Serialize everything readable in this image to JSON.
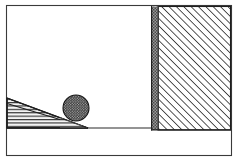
{
  "figure": {
    "title": "Ball resting against inclined wedge beside hatched wall",
    "type": "line-diagram",
    "caption": "",
    "background_color": "#ffffff",
    "ink_color": "#1e1e1e",
    "canvas": {
      "width": 237,
      "height": 161
    }
  },
  "frame": {
    "name": "outer-border",
    "x": 6,
    "y": 5,
    "width": 225,
    "height": 150,
    "stroke_color": "#3a3a3a",
    "stroke_width": 1.1
  },
  "ground": {
    "label": "",
    "y": 128,
    "x_start": 6,
    "x_end": 152,
    "stroke_color": "#2b2b2b"
  },
  "wedge": {
    "name": "inclined-ramp",
    "fill_pattern": "horizontal-hatch",
    "fill_color": "#f2f2f2",
    "hatch_color": "#1e1e1e",
    "apex_x": 88,
    "apex_y": 128,
    "top_x": 7,
    "top_y": 98,
    "base_x": 7,
    "base_y": 128,
    "incline_degrees": 20
  },
  "ball": {
    "name": "sphere",
    "fill_pattern": "stipple-dots",
    "fill_color": "#3c3c3c",
    "dot_color": "#111111",
    "center_x": 76,
    "center_y": 108,
    "radius": 13
  },
  "wall": {
    "name": "fixed-wall-block",
    "fill_pattern": "diagonal-hatch-45",
    "fill_color": "#ffffff",
    "hatch_color": "#1e1e1e",
    "edge_band_color": "#8e8e8e",
    "x": 151,
    "y": 6,
    "width": 80,
    "height": 124,
    "band_width": 7
  },
  "annotations": []
}
